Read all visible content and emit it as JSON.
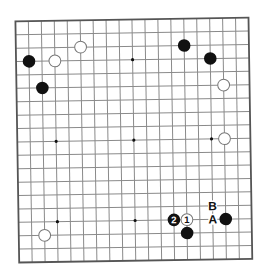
{
  "board": {
    "size": 19,
    "origin": {
      "x": 17.3,
      "y": 19.5
    },
    "spacing": {
      "x": 12.95,
      "y": 13.4
    },
    "rotation_deg": -0.9,
    "colors": {
      "background": "#ffffff",
      "grid_line": "#8a8a8a",
      "border": "#555555",
      "star_point": "#111111",
      "black_stone": "#111111",
      "white_stone_fill": "#ffffff",
      "white_stone_stroke": "#777777",
      "label": "#111111"
    },
    "star_points": [
      [
        3,
        3
      ],
      [
        9,
        3
      ],
      [
        15,
        3
      ],
      [
        3,
        9
      ],
      [
        9,
        9
      ],
      [
        15,
        9
      ],
      [
        3,
        15
      ],
      [
        9,
        15
      ],
      [
        15,
        15
      ]
    ],
    "stones": [
      {
        "color": "black",
        "col": 1,
        "row": 3,
        "label": ""
      },
      {
        "color": "black",
        "col": 2,
        "row": 5,
        "label": ""
      },
      {
        "color": "white",
        "col": 3,
        "row": 3,
        "label": ""
      },
      {
        "color": "white",
        "col": 5,
        "row": 2,
        "label": ""
      },
      {
        "color": "black",
        "col": 13,
        "row": 2,
        "label": ""
      },
      {
        "color": "black",
        "col": 15,
        "row": 3,
        "label": ""
      },
      {
        "color": "white",
        "col": 16,
        "row": 5,
        "label": ""
      },
      {
        "color": "white",
        "col": 16,
        "row": 9,
        "label": ""
      },
      {
        "color": "white",
        "col": 2,
        "row": 16,
        "label": ""
      },
      {
        "color": "black",
        "col": 12,
        "row": 15,
        "label": "2"
      },
      {
        "color": "white",
        "col": 13,
        "row": 15,
        "label": "1"
      },
      {
        "color": "black",
        "col": 13,
        "row": 16,
        "label": ""
      },
      {
        "color": "black",
        "col": 16,
        "row": 15,
        "label": ""
      }
    ],
    "markers": [
      {
        "text": "A",
        "col": 15,
        "row": 15
      },
      {
        "text": "B",
        "col": 15,
        "row": 14
      }
    ]
  }
}
